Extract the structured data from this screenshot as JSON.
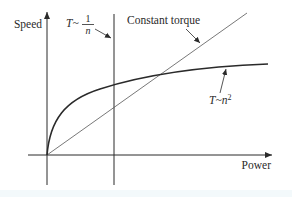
{
  "diagram": {
    "axes": {
      "y_label": "Speed",
      "x_label": "Power"
    },
    "curves": [
      {
        "id": "constant-power",
        "label_prefix": "T~",
        "label_numerator": "1",
        "label_denominator": "n",
        "description": "Vertical line: constant power (T ~ 1/n)"
      },
      {
        "id": "constant-torque",
        "label": "Constant torque",
        "description": "Straight line through origin"
      },
      {
        "id": "fan-load",
        "label_prefix": "T~",
        "label_var": "n",
        "label_exp": "2",
        "description": "Concave curve (T ~ n^2)"
      }
    ],
    "colors": {
      "ink": "#2a2a2a",
      "thin_line": "#555555",
      "background": "#ffffff"
    }
  }
}
